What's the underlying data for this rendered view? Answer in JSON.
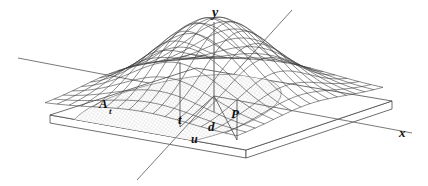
{
  "figure": {
    "caption": "",
    "background_color": "#ffffff",
    "line_color": "#3a3a3a",
    "axis_color": "#555555",
    "label_color": "#101010",
    "stipple_color": "#b9b9b9",
    "slab_fill": "#ffffff",
    "width": 428,
    "height": 186
  },
  "axes": [
    {
      "id": "y-axis",
      "label": "y",
      "orientation": "vertical",
      "label_x": 214,
      "label_y": 15
    },
    {
      "id": "x-axis",
      "label": "x",
      "orientation": "horizontal-right",
      "label_x": 401,
      "label_y": 136
    },
    {
      "id": "u-axis",
      "label": "",
      "orientation": "diagonal",
      "label_x": 0,
      "label_y": 0
    }
  ],
  "labels": [
    {
      "id": "label-A-t",
      "text": "A",
      "subscript": "t",
      "x": 103,
      "y": 109
    },
    {
      "id": "label-t",
      "text": "t",
      "x": 181,
      "y": 122
    },
    {
      "id": "label-d",
      "text": "d",
      "x": 211,
      "y": 129
    },
    {
      "id": "label-P",
      "text": "P",
      "x": 235,
      "y": 117
    },
    {
      "id": "label-u",
      "text": "u",
      "x": 194,
      "y": 141
    },
    {
      "id": "label-y",
      "text": "y",
      "x": 212,
      "y": 17
    },
    {
      "id": "label-x",
      "text": "x",
      "x": 399,
      "y": 137
    }
  ],
  "chart_data": {
    "type": "surface",
    "title": "",
    "xlabel": "x",
    "ylabel": "y",
    "zlabel": "u",
    "surface_function": "gaussian-bell",
    "grid": true,
    "legend": false,
    "annotations": [
      {
        "name": "A_t",
        "meaning": "stippled base region"
      },
      {
        "name": "t",
        "meaning": "center point on base"
      },
      {
        "name": "P",
        "meaning": "point on base"
      },
      {
        "name": "d",
        "meaning": "distance from t to P"
      },
      {
        "name": "u",
        "meaning": "third axis"
      }
    ]
  }
}
